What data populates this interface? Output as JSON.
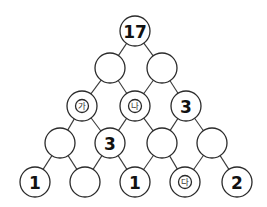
{
  "diagram": {
    "type": "number-pyramid",
    "radius": 15,
    "colors": {
      "stroke": "#2a2a2a",
      "fill": "#ffffff",
      "text": "#111111"
    },
    "rows": [
      [
        {
          "id": "r0c0",
          "x": 135,
          "y": 31,
          "value": "17",
          "kind": "number"
        }
      ],
      [
        {
          "id": "r1c0",
          "x": 110,
          "y": 68,
          "value": "",
          "kind": "empty"
        },
        {
          "id": "r1c1",
          "x": 162,
          "y": 68,
          "value": "",
          "kind": "empty"
        }
      ],
      [
        {
          "id": "r2c0",
          "x": 82,
          "y": 106,
          "value": "가",
          "kind": "label"
        },
        {
          "id": "r2c1",
          "x": 135,
          "y": 106,
          "value": "나",
          "kind": "label"
        },
        {
          "id": "r2c2",
          "x": 186,
          "y": 106,
          "value": "3",
          "kind": "number"
        }
      ],
      [
        {
          "id": "r3c0",
          "x": 60,
          "y": 143,
          "value": "",
          "kind": "empty"
        },
        {
          "id": "r3c1",
          "x": 110,
          "y": 143,
          "value": "3",
          "kind": "number"
        },
        {
          "id": "r3c2",
          "x": 162,
          "y": 143,
          "value": "",
          "kind": "empty"
        },
        {
          "id": "r3c3",
          "x": 212,
          "y": 143,
          "value": "",
          "kind": "empty"
        }
      ],
      [
        {
          "id": "r4c0",
          "x": 35,
          "y": 182,
          "value": "1",
          "kind": "number"
        },
        {
          "id": "r4c1",
          "x": 85,
          "y": 182,
          "value": "",
          "kind": "empty"
        },
        {
          "id": "r4c2",
          "x": 135,
          "y": 182,
          "value": "1",
          "kind": "number"
        },
        {
          "id": "r4c3",
          "x": 185,
          "y": 182,
          "value": "다",
          "kind": "label"
        },
        {
          "id": "r4c4",
          "x": 237,
          "y": 182,
          "value": "2",
          "kind": "number"
        }
      ]
    ]
  }
}
